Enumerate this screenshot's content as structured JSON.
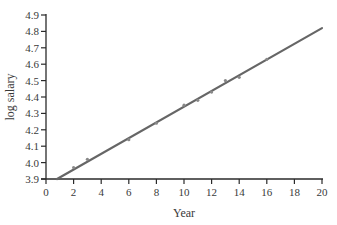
{
  "chart_data": {
    "type": "scatter",
    "title": "",
    "xlabel": "Year",
    "ylabel": "log salary",
    "xlim": [
      0,
      20
    ],
    "ylim": [
      3.9,
      4.9
    ],
    "x_ticks": [
      0,
      2,
      4,
      6,
      8,
      10,
      12,
      14,
      16,
      18,
      20
    ],
    "y_ticks": [
      3.9,
      4.0,
      4.1,
      4.2,
      4.3,
      4.4,
      4.5,
      4.6,
      4.7,
      4.8,
      4.9
    ],
    "x_tick_labels": [
      "0",
      "2",
      "4",
      "6",
      "8",
      "10",
      "12",
      "14",
      "16",
      "18",
      "20"
    ],
    "y_tick_labels": [
      "3.9",
      "4.0",
      "4.1",
      "4.2",
      "4.3",
      "4.4",
      "4.5",
      "4.6",
      "4.7",
      "4.8",
      "4.9"
    ],
    "grid": false,
    "legend": null,
    "series": [
      {
        "name": "observed",
        "type": "scatter",
        "x": [
          2,
          3,
          6,
          8,
          10,
          11,
          12,
          13,
          14,
          16
        ],
        "y": [
          3.97,
          4.02,
          4.14,
          4.24,
          4.35,
          4.38,
          4.43,
          4.5,
          4.52,
          4.63
        ]
      },
      {
        "name": "fitted line",
        "type": "line",
        "x": [
          0.8,
          20
        ],
        "y": [
          3.9,
          4.82
        ]
      }
    ]
  },
  "colors": {
    "axis": "#2a2a2a",
    "line": "#666666",
    "points": "#888888",
    "text": "#3a3a3a"
  }
}
